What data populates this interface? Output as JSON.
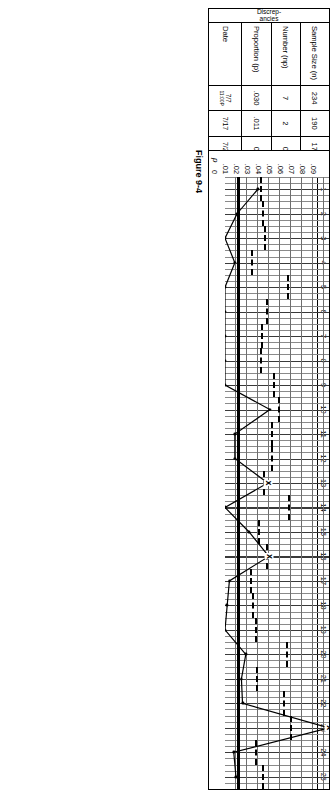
{
  "figure": {
    "caption": "Figure 9-4"
  },
  "table": {
    "group_label": "Discrep-\nancies",
    "row_labels": [
      "Sample Size (n)",
      "Number (np)",
      "Proportion (p)",
      "Date"
    ],
    "columns": [
      {
        "n": "234",
        "np": "7",
        "p": ".030",
        "date": "7/7",
        "date2": "11:00P"
      },
      {
        "n": "190",
        "np": "2",
        "p": ".011",
        "date": "7/17",
        "date2": ""
      },
      {
        "n": "173",
        "np": "0",
        "p": "0",
        "date": "7/20",
        "date2": ""
      },
      {
        "n": "587",
        "np": "5",
        "p": ".009",
        "date": "7/23",
        "date2": ""
      },
      {
        "n": "51",
        "np": "0",
        "p": "0",
        "date": "7/24",
        "date2": ""
      },
      {
        "n": "148",
        "np": "0",
        "p": "0",
        "date": "7/24",
        "date2": ""
      },
      {
        "n": "212",
        "np": "0",
        "p": "0",
        "date": "7/24",
        "date2": ""
      },
      {
        "n": "229",
        "np": "0",
        "p": "0",
        "date": "7/25",
        "date2": ""
      },
      {
        "n": "96",
        "np": "0",
        "p": "0",
        "date": "8/4",
        "date2": ""
      },
      {
        "n": "74",
        "np": "3",
        "p": ".041",
        "date": "8/8",
        "date2": ""
      },
      {
        "n": "110",
        "np": "1",
        "p": ".009",
        "date": "8/13",
        "date2": ""
      },
      {
        "n": "112",
        "np": "1",
        "p": ".009",
        "date": "8/18",
        "date2": ""
      },
      {
        "n": "179",
        "np": "7",
        "p": ".039",
        "date": "8/18",
        "date2": ""
      },
      {
        "n": "49",
        "np": "0",
        "p": "0",
        "date": "8/25",
        "date2": ""
      },
      {
        "n": "272",
        "np": "6",
        "p": ".022",
        "date": "8/26",
        "date2": ""
      },
      {
        "n": "149",
        "np": "6",
        "p": ".040",
        "date": "9/2",
        "date2": ""
      },
      {
        "n": "744",
        "np": "3",
        "p": ".004",
        "date": "9/10",
        "date2": ""
      },
      {
        "n": "540",
        "np": "1",
        "p": ".002",
        "date": "9/11",
        "date2": ""
      },
      {
        "n": "387",
        "np": "0",
        "p": "0",
        "date": "9/14",
        "date2": ""
      },
      {
        "n": "54",
        "np": "1",
        "p": ".019",
        "date": "9/16",
        "date2": ""
      },
      {
        "n": "325",
        "np": "5",
        "p": ".015",
        "date": "9/16",
        "date2": ""
      },
      {
        "n": "61",
        "np": "1",
        "p": ".016",
        "date": "9/18",
        "date2": ""
      },
      {
        "n": "45",
        "np": "5",
        "p": ".111",
        "date": "9/18",
        "date2": ""
      },
      {
        "n": "365",
        "np": "3",
        "p": ".008",
        "date": "9/18",
        "date2": ""
      },
      {
        "n": "206",
        "np": "2",
        "p": ".010",
        "date": "9/18",
        "date2": ""
      }
    ]
  },
  "chart_labels": {
    "ucl": "UCL",
    "ucl_sub": "p",
    "pbar": "p",
    "out_of_control_marker": "x"
  },
  "chart_data": {
    "type": "line",
    "title": "",
    "xlabel": "",
    "ylabel": "p",
    "x": [
      1,
      2,
      3,
      4,
      5,
      6,
      7,
      8,
      9,
      10,
      11,
      12,
      13,
      14,
      15,
      16,
      17,
      18,
      19,
      20,
      21,
      22,
      23,
      24,
      25
    ],
    "xtick_labels": [
      "1",
      "2",
      "3",
      "4",
      "5",
      "6",
      "7",
      "8",
      "9",
      "10",
      "11",
      "12",
      "13",
      "14",
      "15",
      "16",
      "17",
      "18",
      "19",
      "20",
      "21",
      "22",
      "23",
      "24",
      "25"
    ],
    "ytick_labels": [
      "0",
      ".01",
      ".02",
      ".03",
      ".04",
      ".05",
      ".06",
      ".07",
      ".08",
      ".09"
    ],
    "ytick_values": [
      0,
      0.01,
      0.02,
      0.03,
      0.04,
      0.05,
      0.06,
      0.07,
      0.08,
      0.09
    ],
    "ylim": [
      0,
      0.095
    ],
    "xlim": [
      0.5,
      25.5
    ],
    "grid": true,
    "legend": "none",
    "series": [
      {
        "name": "p",
        "values": [
          0.03,
          0.011,
          0.0,
          0.009,
          0.0,
          0.0,
          0.0,
          0.0,
          0.0,
          0.041,
          0.009,
          0.009,
          0.039,
          0.0,
          0.022,
          0.04,
          0.004,
          0.002,
          0.0,
          0.019,
          0.015,
          0.016,
          0.111,
          0.008,
          0.01
        ]
      }
    ],
    "center_line": {
      "name": "pbar",
      "value": 0.0122
    },
    "control_limits": {
      "name": "UCLp",
      "values": [
        0.0338,
        0.036,
        0.0372,
        0.0258,
        0.0584,
        0.0393,
        0.0348,
        0.034,
        0.0459,
        0.0506,
        0.0438,
        0.0435,
        0.0368,
        0.0593,
        0.0321,
        0.0392,
        0.0243,
        0.0265,
        0.029,
        0.0572,
        0.0305,
        0.0545,
        0.0613,
        0.0295,
        0.0352
      ]
    },
    "out_of_control_points": [
      13,
      16,
      23
    ],
    "annotations": [
      {
        "x": 23,
        "text": "x"
      }
    ]
  }
}
